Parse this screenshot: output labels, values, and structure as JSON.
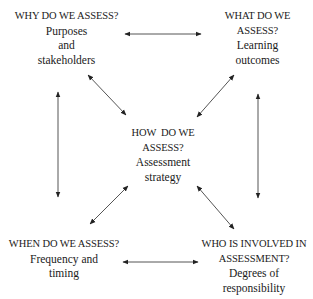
{
  "diagram": {
    "type": "concept-map",
    "nodes": [
      {
        "id": "why",
        "position": "top-left",
        "question_lines": [
          "WHY DO WE ASSESS?"
        ],
        "answer_lines": [
          "Purposes",
          "and",
          "stakeholders"
        ]
      },
      {
        "id": "what",
        "position": "top-right",
        "question_lines": [
          "WHAT DO WE",
          "ASSESS?"
        ],
        "answer_lines": [
          "Learning",
          "outcomes"
        ]
      },
      {
        "id": "how",
        "position": "center",
        "question_lines": [
          "HOW  DO WE",
          "ASSESS?"
        ],
        "answer_lines": [
          "Assessment",
          "strategy"
        ]
      },
      {
        "id": "when",
        "position": "bottom-left",
        "question_lines": [
          "WHEN DO WE ASSESS?"
        ],
        "answer_lines": [
          "Frequency and",
          "timing"
        ]
      },
      {
        "id": "who",
        "position": "bottom-right",
        "question_lines": [
          "WHO IS INVOLVED IN",
          "ASSESSMENT?"
        ],
        "answer_lines": [
          "Degrees of",
          "responsibility"
        ]
      }
    ],
    "edges": [
      {
        "from": "why",
        "to": "what",
        "direction": "both"
      },
      {
        "from": "when",
        "to": "who",
        "direction": "both"
      },
      {
        "from": "why",
        "to": "when",
        "direction": "both"
      },
      {
        "from": "what",
        "to": "who",
        "direction": "both"
      },
      {
        "from": "why",
        "to": "how",
        "direction": "both"
      },
      {
        "from": "what",
        "to": "how",
        "direction": "both"
      },
      {
        "from": "when",
        "to": "how",
        "direction": "both"
      },
      {
        "from": "who",
        "to": "how",
        "direction": "both"
      }
    ],
    "colors": {
      "text": "#1a1a1a",
      "arrow": "#555555",
      "background": "#ffffff"
    }
  }
}
